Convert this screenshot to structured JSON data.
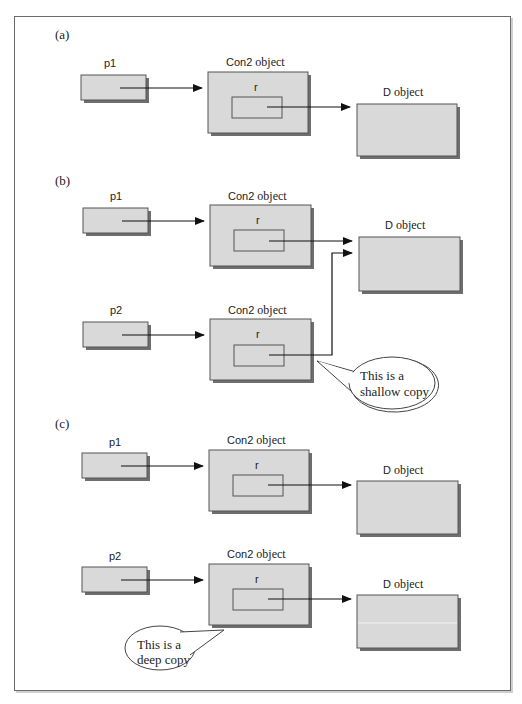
{
  "figure": {
    "panels": [
      {
        "id": "a",
        "label": "(a)",
        "pointers": [
          {
            "name": "p1"
          }
        ],
        "con2_objects": [
          {
            "title_code": "Con2",
            "title_text": "object",
            "member": "r"
          }
        ],
        "d_objects": [
          {
            "title_code": "D",
            "title_text": "object"
          }
        ]
      },
      {
        "id": "b",
        "label": "(b)",
        "pointers": [
          {
            "name": "p1"
          },
          {
            "name": "p2"
          }
        ],
        "con2_objects": [
          {
            "title_code": "Con2",
            "title_text": "object",
            "member": "r"
          },
          {
            "title_code": "Con2",
            "title_text": "object",
            "member": "r"
          }
        ],
        "d_objects": [
          {
            "title_code": "D",
            "title_text": "object"
          }
        ],
        "callout": {
          "line1": "This is a",
          "line2": "shallow copy"
        }
      },
      {
        "id": "c",
        "label": "(c)",
        "pointers": [
          {
            "name": "p1"
          },
          {
            "name": "p2"
          }
        ],
        "con2_objects": [
          {
            "title_code": "Con2",
            "title_text": "object",
            "member": "r"
          },
          {
            "title_code": "Con2",
            "title_text": "object",
            "member": "r"
          }
        ],
        "d_objects": [
          {
            "title_code": "D",
            "title_text": "object"
          },
          {
            "title_code": "D",
            "title_text": "object"
          }
        ],
        "callout": {
          "line1": "This is a",
          "line2": "deep copy"
        }
      }
    ]
  },
  "colors": {
    "box_fill": "#d9d9d9",
    "box_border": "#555555",
    "box_shadow": "#6e6e6e",
    "arrow": "#111111"
  }
}
